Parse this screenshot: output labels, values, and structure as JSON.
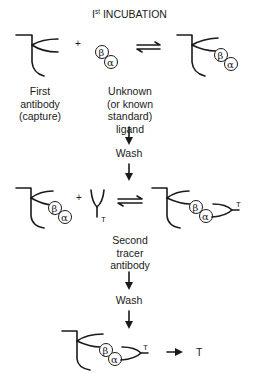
{
  "title": {
    "main": "I",
    "sup": "st",
    "rest": " INCUBATION"
  },
  "labels": {
    "first_antibody": [
      "First",
      "antibody",
      "(capture)"
    ],
    "ligand": [
      "Unknown",
      "(or known",
      "standard)",
      "ligand"
    ],
    "wash_1": "Wash",
    "second_tracer": [
      "Second",
      "tracer",
      "antibody"
    ],
    "wash_2": "Wash"
  },
  "symbols": {
    "beta": "β",
    "alpha": "α",
    "tracer": "T",
    "plus": "+",
    "product_tracer": "T"
  },
  "steps": [
    {
      "name": "first-incubation",
      "reactants": [
        "First antibody (capture)",
        "Ligand (β/α)"
      ],
      "product": "Antibody–ligand complex",
      "relation": "equilibrium"
    },
    {
      "name": "wash-1"
    },
    {
      "name": "second-incubation",
      "reactants": [
        "Antibody–ligand complex",
        "Tracer antibody (T)"
      ],
      "product": "Sandwich complex",
      "relation": "equilibrium"
    },
    {
      "name": "wash-2"
    },
    {
      "name": "detection",
      "reactants": [
        "Sandwich complex"
      ],
      "product": "T",
      "relation": "arrow"
    }
  ]
}
